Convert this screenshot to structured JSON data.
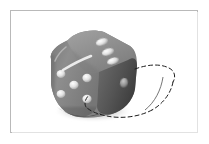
{
  "figure": {
    "kind": "photograph",
    "background_color": "#ffffff",
    "frame": {
      "border_color": "#b9b9b9",
      "inner_shadow_color": "#e2e2e2",
      "style": "thin rectangular photo border"
    }
  },
  "die": {
    "label": "die",
    "body_color": "#8b8b8b",
    "top_face_color": "#969696",
    "left_face_color": "#8a8a8a",
    "right_face_color": "#5a5a5a",
    "pip_color": "#e8e8e8",
    "pip_shadow_color": "#6e6e6e",
    "highlight_color": "#f2f2f2",
    "shadow_color": "#bdbdbd",
    "faces": [
      {
        "name": "top-face",
        "visible_pips": 3
      },
      {
        "name": "left-front-face",
        "visible_pips": 5
      },
      {
        "name": "right-face",
        "visible_pips": 1
      }
    ],
    "specular_highlight": "diagonal white streak across the upper-left edge"
  },
  "ghost_outline": {
    "label": "dashed ghost outline",
    "stroke_color": "#1c1c1c",
    "stroke_width": 1,
    "dash_pattern": "4 3",
    "description": "hand-drawn dashed contour of the die in a displaced position to the lower right"
  },
  "annotations": {
    "title": "",
    "caption": "",
    "notes": ""
  }
}
